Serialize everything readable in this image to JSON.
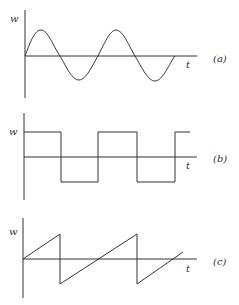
{
  "panels": [
    {
      "id": "a",
      "caption": "(a)",
      "y_label": "w",
      "x_label": "t",
      "waveform": "sine"
    },
    {
      "id": "b",
      "caption": "(b)",
      "y_label": "w",
      "x_label": "t",
      "waveform": "square"
    },
    {
      "id": "c",
      "caption": "(c)",
      "y_label": "w",
      "x_label": "t",
      "waveform": "sawtooth"
    }
  ],
  "colors": {
    "ink": "#333333",
    "background": "#ffffff"
  }
}
